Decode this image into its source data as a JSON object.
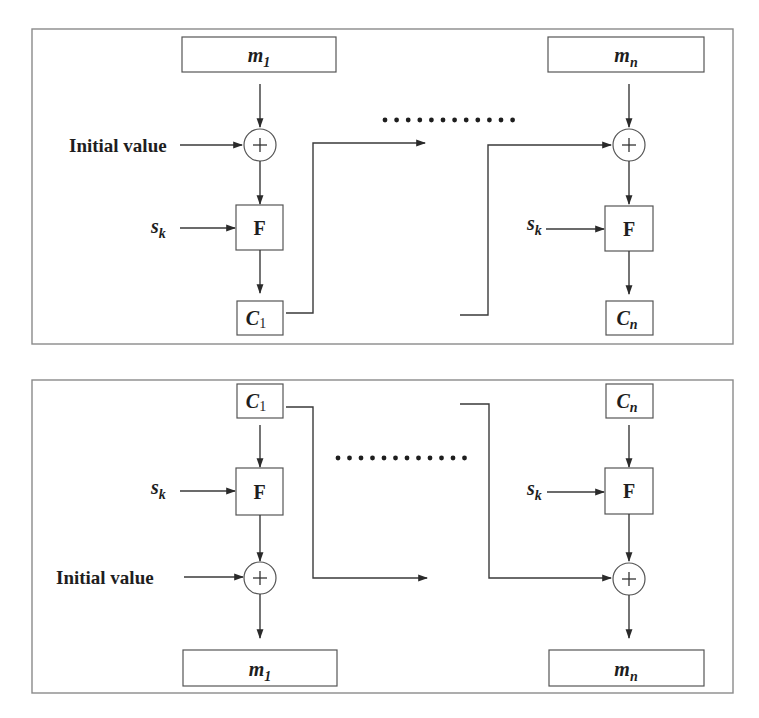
{
  "diagram": {
    "type": "block-cipher-chaining",
    "encryption_panel": {
      "inputs": [
        {
          "label_base": "m",
          "label_sub": "1"
        },
        {
          "label_base": "m",
          "label_sub": "n"
        }
      ],
      "initial_value_label": "Initial value",
      "key_label_base": "s",
      "key_label_sub": "k",
      "function_label": "F",
      "outputs": [
        {
          "label_base": "C",
          "label_sub": "1"
        },
        {
          "label_base": "C",
          "label_sub": "n"
        }
      ],
      "ellipsis_dots": 12
    },
    "decryption_panel": {
      "inputs": [
        {
          "label_base": "C",
          "label_sub": "1"
        },
        {
          "label_base": "C",
          "label_sub": "n"
        }
      ],
      "initial_value_label": "Initial value",
      "key_label_base": "s",
      "key_label_sub": "k",
      "function_label": "F",
      "outputs": [
        {
          "label_base": "m",
          "label_sub": "1"
        },
        {
          "label_base": "m",
          "label_sub": "n"
        }
      ],
      "ellipsis_dots": 12
    },
    "xor_symbol": "+",
    "colors": {
      "line": "#3a3a3a",
      "border": "#8a8a8a",
      "text": "#1e1e1e",
      "background": "#ffffff"
    }
  }
}
